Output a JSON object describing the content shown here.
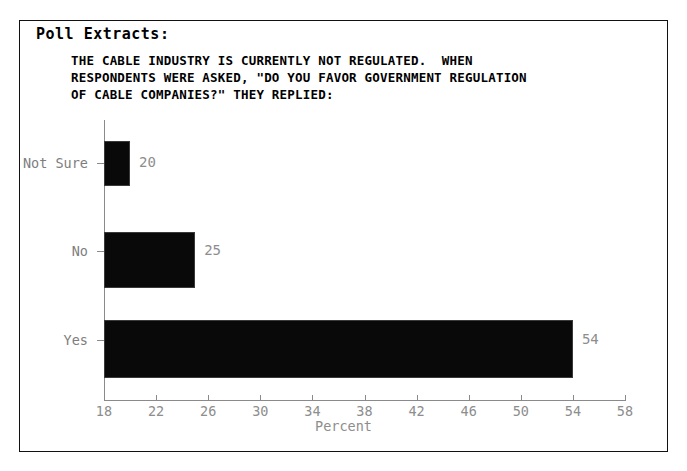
{
  "panel": {
    "title": "Poll Extracts:",
    "question_lines": [
      "THE CABLE INDUSTRY IS CURRENTLY NOT REGULATED.  WHEN",
      "RESPONDENTS WERE ASKED, \"DO YOU FAVOR GOVERNMENT REGULATION",
      "OF CABLE COMPANIES?\" THEY REPLIED:"
    ],
    "question_text": "THE CABLE INDUSTRY IS CURRENTLY NOT REGULATED.  WHEN\nRESPONDENTS WERE ASKED, \"DO YOU FAVOR GOVERNMENT REGULATION\nOF CABLE COMPANIES?\" THEY REPLIED:",
    "border_color": "#111111",
    "background_color": "#ffffff"
  },
  "chart_data": {
    "type": "bar",
    "orientation": "horizontal",
    "title": "",
    "categories": [
      "Not Sure",
      "No",
      "Yes"
    ],
    "values": [
      20,
      25,
      54
    ],
    "value_labels": [
      "20",
      "25",
      "54"
    ],
    "xlabel": "Percent",
    "ylabel": "",
    "xlim": [
      18,
      58
    ],
    "xticks": [
      18,
      22,
      26,
      30,
      34,
      38,
      42,
      46,
      50,
      54,
      58
    ],
    "xtick_labels": [
      "18",
      "22",
      "26",
      "30",
      "34",
      "38",
      "42",
      "46",
      "50",
      "54",
      "58"
    ],
    "grid": false,
    "legend": false,
    "bar_color": "#090909",
    "axis_color": "#8a8a8a",
    "label_color": "#8d8d8d"
  }
}
